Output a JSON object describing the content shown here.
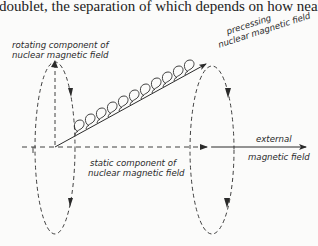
{
  "page": {
    "top_text": "doublet, the separation of which depends on how near each pro"
  },
  "diagram": {
    "labels": {
      "rotating_line1": "rotating component of",
      "rotating_line2": "nuclear magnetic field",
      "precessing_line1": "precessing",
      "precessing_line2": "nuclear magnetic field",
      "static_line1": "static component of",
      "static_line2": "nuclear magnetic field",
      "external_line1": "external",
      "external_line2": "magnetic field"
    },
    "colors": {
      "ink": "#2a2a2a",
      "background": "#fbfbfa"
    }
  }
}
